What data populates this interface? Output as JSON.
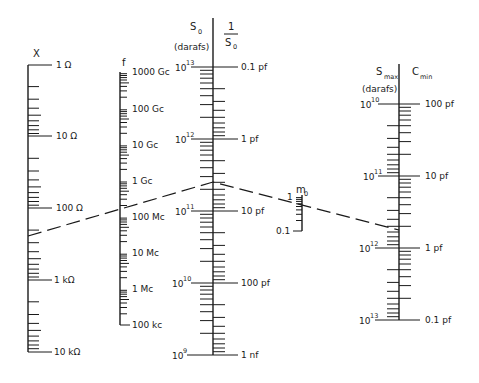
{
  "diagram": {
    "type": "nomograph",
    "scales": {
      "x": {
        "header": "X",
        "labels": [
          "1 Ω",
          "10 Ω",
          "100 Ω",
          "1 kΩ",
          "10 kΩ"
        ]
      },
      "f": {
        "header": "f",
        "labels": [
          "1000 Gc",
          "100 Gc",
          "10 Gc",
          "1 Gc",
          "100 Mc",
          "10 Mc",
          "1 Mc",
          "100 kc"
        ]
      },
      "s0": {
        "header_left": "S",
        "header_left_sub": "0",
        "header_left_unit": "(darafs)",
        "header_right_num": "1",
        "header_right_den": "S",
        "header_right_den_sub": "0",
        "left_labels": [
          {
            "base": "10",
            "exp": "13"
          },
          {
            "base": "10",
            "exp": "12"
          },
          {
            "base": "10",
            "exp": "11"
          },
          {
            "base": "10",
            "exp": "10"
          },
          {
            "base": "10",
            "exp": "9"
          }
        ],
        "right_labels": [
          "0.1 pf",
          "1 pf",
          "10 pf",
          "100 pf",
          "1 nf"
        ]
      },
      "m0": {
        "header": "m",
        "header_sub": "0",
        "labels": [
          "1",
          "0.1"
        ]
      },
      "smax": {
        "header_left": "S",
        "header_left_sub": "max",
        "header_left_unit": "(darafs)",
        "header_right": "C",
        "header_right_sub": "min",
        "left_labels": [
          {
            "base": "10",
            "exp": "10"
          },
          {
            "base": "10",
            "exp": "11"
          },
          {
            "base": "10",
            "exp": "12"
          },
          {
            "base": "10",
            "exp": "13"
          }
        ],
        "right_labels": [
          "100 pf",
          "10 pf",
          "1 pf",
          "0.1 pf"
        ]
      }
    },
    "example_line": {
      "description": "dashed isopleth connecting X, S0 pivot and Smax scales",
      "points": [
        [
          28,
          236
        ],
        [
          213,
          182
        ],
        [
          399,
          230
        ]
      ]
    }
  }
}
